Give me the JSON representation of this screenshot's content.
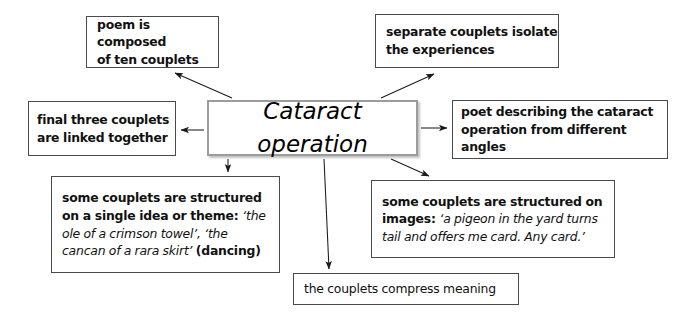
{
  "diagram": {
    "center": {
      "label": "Cataract operation",
      "name": "center-node"
    },
    "nodes": [
      {
        "id": "top-left",
        "name": "node-poem-composed",
        "lines": [
          [
            {
              "text": "poem is composed",
              "style": "bold"
            }
          ],
          [
            {
              "text": "of ten couplets",
              "style": "bold"
            }
          ]
        ]
      },
      {
        "id": "top-right",
        "name": "node-separate-couplets",
        "lines": [
          [
            {
              "text": "separate couplets isolate",
              "style": "bold"
            }
          ],
          [
            {
              "text": "the experiences",
              "style": "bold"
            }
          ]
        ]
      },
      {
        "id": "left",
        "name": "node-final-three-couplets",
        "lines": [
          [
            {
              "text": "final three couplets",
              "style": "bold"
            }
          ],
          [
            {
              "text": "are linked together",
              "style": "bold"
            }
          ]
        ]
      },
      {
        "id": "right",
        "name": "node-poet-describing",
        "lines": [
          [
            {
              "text": "poet describing the cataract",
              "style": "bold"
            }
          ],
          [
            {
              "text": "operation from different angles",
              "style": "bold"
            }
          ]
        ]
      },
      {
        "id": "bottom-left",
        "name": "node-structured-single-idea",
        "lines": [
          [
            {
              "text": "some couplets are structured",
              "style": "bold"
            }
          ],
          [
            {
              "text": "on a single idea or theme: ",
              "style": "bold"
            },
            {
              "text": "‘the",
              "style": "italic"
            }
          ],
          [
            {
              "text": "ole of a crimson towel’, ‘the",
              "style": "italic"
            }
          ],
          [
            {
              "text": "cancan of a rara skirt’ ",
              "style": "italic"
            },
            {
              "text": "(dancing)",
              "style": "bold"
            }
          ]
        ]
      },
      {
        "id": "bottom-right",
        "name": "node-structured-images",
        "lines": [
          [
            {
              "text": "some couplets are structured on",
              "style": "bold"
            }
          ],
          [
            {
              "text": "images: ",
              "style": "bold"
            },
            {
              "text": "‘a pigeon in the yard turns",
              "style": "italic"
            }
          ],
          [
            {
              "text": "tail and offers me card. Any card.’",
              "style": "italic"
            }
          ]
        ]
      },
      {
        "id": "bottom",
        "name": "node-compress-meaning",
        "lines": [
          [
            {
              "text": "the couplets compress meaning",
              "style": "plain"
            }
          ]
        ]
      }
    ],
    "arrows": [
      {
        "name": "arrow-center-to-poem-composed",
        "from": "center",
        "to": "top-left"
      },
      {
        "name": "arrow-center-to-separate-couplets",
        "from": "center",
        "to": "top-right"
      },
      {
        "name": "arrow-center-to-final-three-couplets",
        "from": "center",
        "to": "left"
      },
      {
        "name": "arrow-center-to-poet-describing",
        "from": "center",
        "to": "right"
      },
      {
        "name": "arrow-center-to-structured-single-idea",
        "from": "center",
        "to": "bottom-left"
      },
      {
        "name": "arrow-center-to-structured-images",
        "from": "center",
        "to": "bottom-right"
      },
      {
        "name": "arrow-center-to-compress-meaning",
        "from": "center",
        "to": "bottom"
      }
    ],
    "colors": {
      "box_border": "#4a4a4a",
      "center_border": "#9c9c9c",
      "text": "#111111",
      "arrow": "#1a1a1a",
      "background": "#ffffff"
    }
  }
}
